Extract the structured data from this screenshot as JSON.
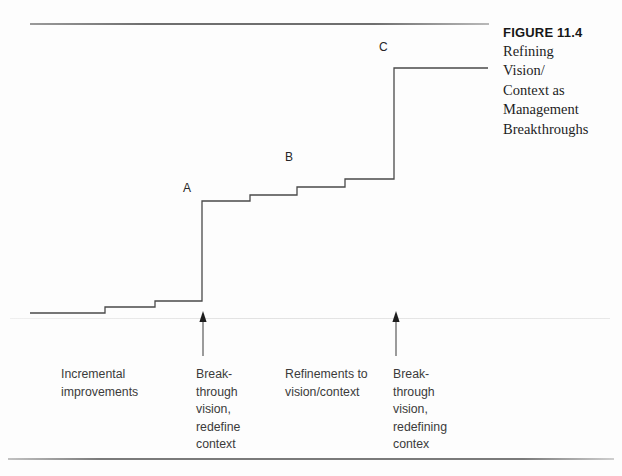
{
  "figure": {
    "caption_title": "FIGURE 11.4",
    "caption_lines": [
      "Refining",
      "Vision/",
      "Context as",
      "Management",
      "Breakthroughs"
    ]
  },
  "chart_data": {
    "type": "line",
    "xlabel": "",
    "ylabel": "",
    "grid": false,
    "legend": null,
    "baseline_y": 313,
    "step_points": [
      {
        "x": 30,
        "y": 313
      },
      {
        "x": 105,
        "y": 313
      },
      {
        "x": 105,
        "y": 307
      },
      {
        "x": 155,
        "y": 307
      },
      {
        "x": 155,
        "y": 301
      },
      {
        "x": 202,
        "y": 301
      },
      {
        "x": 202,
        "y": 201
      },
      {
        "x": 250,
        "y": 201
      },
      {
        "x": 250,
        "y": 195
      },
      {
        "x": 297,
        "y": 195
      },
      {
        "x": 297,
        "y": 187
      },
      {
        "x": 345,
        "y": 187
      },
      {
        "x": 345,
        "y": 179
      },
      {
        "x": 394,
        "y": 179
      },
      {
        "x": 394,
        "y": 68
      },
      {
        "x": 488,
        "y": 68
      }
    ],
    "point_labels": [
      {
        "label": "A",
        "x": 202,
        "y": 201
      },
      {
        "label": "B",
        "x": 297,
        "y": 187
      },
      {
        "label": "C",
        "x": 394,
        "y": 68
      }
    ],
    "arrows": [
      {
        "x": 203,
        "y_tail": 356,
        "y_head": 311
      },
      {
        "x": 396,
        "y_tail": 356,
        "y_head": 311
      }
    ],
    "annotations": [
      {
        "lines": [
          "Incremental",
          "improvements"
        ]
      },
      {
        "lines": [
          "Break-",
          "through",
          "vision,",
          "redefine",
          "context"
        ]
      },
      {
        "lines": [
          "Refinements to",
          "vision/context"
        ]
      },
      {
        "lines": [
          "Break-",
          "through",
          "vision,",
          "redefining",
          "contex"
        ]
      }
    ]
  }
}
